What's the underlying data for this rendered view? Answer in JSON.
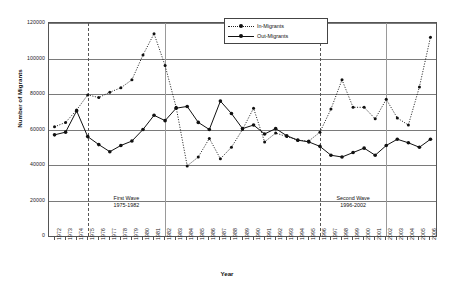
{
  "chart_data": {
    "type": "line",
    "title": "",
    "xlabel": "Year",
    "ylabel": "Number of Migrants",
    "ylim": [
      0,
      120000
    ],
    "ytick_values": [
      0,
      20000,
      40000,
      60000,
      80000,
      100000,
      120000
    ],
    "ytick_labels": [
      "0",
      "20000",
      "40000",
      "60000",
      "80000",
      "100000",
      "120000"
    ],
    "grid": true,
    "legend_position": "top-center",
    "categories": [
      "1972",
      "1973",
      "1974",
      "1975",
      "1976",
      "1977",
      "1978",
      "1979",
      "1980",
      "1981",
      "1982",
      "1983",
      "1984",
      "1985",
      "1986",
      "1987",
      "1988",
      "1989",
      "1990",
      "1991",
      "1992",
      "1993",
      "1994",
      "1995",
      "1996",
      "1997",
      "1998",
      "1999",
      "2000",
      "2001",
      "2002",
      "2003",
      "2004",
      "2005",
      "2006"
    ],
    "series": [
      {
        "name": "In-Migrants",
        "style": "dotted",
        "values": [
          61500,
          64000,
          71000,
          79500,
          78000,
          81000,
          83500,
          88000,
          102000,
          114000,
          96000,
          72500,
          39500,
          44500,
          55000,
          43500,
          50000,
          60000,
          72000,
          53000,
          58000,
          56000,
          54000,
          53500,
          58500,
          71500,
          88000,
          72500,
          72500,
          66000,
          77000,
          66500,
          62500,
          84000,
          112000
        ]
      },
      {
        "name": "Out-Migrants",
        "style": "solid",
        "values": [
          57000,
          58500,
          70500,
          56000,
          51500,
          47500,
          51000,
          53500,
          60000,
          68000,
          65000,
          72000,
          73000,
          64000,
          60000,
          76000,
          69000,
          60500,
          62500,
          57500,
          60500,
          56500,
          54000,
          53000,
          50500,
          45500,
          44500,
          47000,
          49500,
          45500,
          51000,
          54500,
          52500,
          50000,
          54500
        ]
      }
    ],
    "annotations": [
      {
        "title": "First Wave",
        "range": "1975-1982",
        "start_year": "1975",
        "end_year": "1982"
      },
      {
        "title": "Second Wave",
        "range": "1996-2002",
        "start_year": "1996",
        "end_year": "2002"
      }
    ],
    "reference_lines": [
      {
        "year": "1975",
        "style": "dashed"
      },
      {
        "year": "1982",
        "style": "solid"
      },
      {
        "year": "1996",
        "style": "dashed"
      },
      {
        "year": "2002",
        "style": "solid"
      }
    ],
    "colors": {
      "in_migrants": "#111111",
      "out_migrants": "#111111",
      "grid": "#7a7a7a",
      "axis": "#555555"
    }
  }
}
